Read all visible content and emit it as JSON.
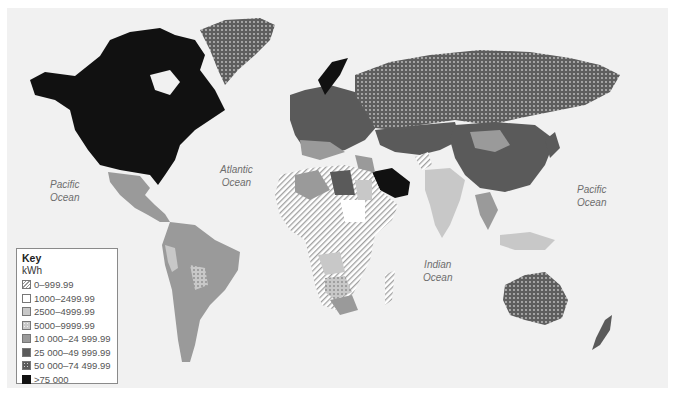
{
  "map": {
    "subject": "Electricity consumption per capita by country",
    "ocean_labels": [
      {
        "id": "pacific-west",
        "line1": "Pacific",
        "line2": "Ocean"
      },
      {
        "id": "atlantic",
        "line1": "Atlantic",
        "line2": "Ocean"
      },
      {
        "id": "indian",
        "line1": "Indian",
        "line2": "Ocean"
      },
      {
        "id": "pacific-east",
        "line1": "Pacific",
        "line2": "Ocean"
      }
    ]
  },
  "legend": {
    "title": "Key",
    "unit": "kWh",
    "items": [
      {
        "label": "0–999.99",
        "fill": "hatched",
        "color": "#ffffff"
      },
      {
        "label": "1000–2499.99",
        "fill": "solid",
        "color": "#ffffff"
      },
      {
        "label": "2500–4999.99",
        "fill": "solid",
        "color": "#c8c8c8"
      },
      {
        "label": "5000–9999.99",
        "fill": "dotted",
        "color": "#c8c8c8"
      },
      {
        "label": "10 000–24 999.99",
        "fill": "solid",
        "color": "#9a9a9a"
      },
      {
        "label": "25 000–49 999.99",
        "fill": "solid",
        "color": "#5a5a5a"
      },
      {
        "label": "50 000–74 499.99",
        "fill": "dotted",
        "color": "#5a5a5a"
      },
      {
        "label": ">75 000",
        "fill": "solid",
        "color": "#111111"
      }
    ]
  },
  "regions": [
    {
      "name": "North America (USA, Canada)",
      "category": ">75 000"
    },
    {
      "name": "Greenland",
      "category": "50 000–74 499.99"
    },
    {
      "name": "Mexico & Central America",
      "category": "10 000–24 999.99"
    },
    {
      "name": "South America (most)",
      "category": "10 000–24 999.99"
    },
    {
      "name": "Peru",
      "category": "2500–4999.99"
    },
    {
      "name": "Bolivia",
      "category": "5000–9999.99"
    },
    {
      "name": "Russia",
      "category": "50 000–74 499.99"
    },
    {
      "name": "Norway",
      "category": ">75 000"
    },
    {
      "name": "Europe (most)",
      "category": "25 000–49 999.99"
    },
    {
      "name": "Saudi Arabia",
      "category": ">75 000"
    },
    {
      "name": "Afghanistan",
      "category": "0–999.99"
    },
    {
      "name": "China",
      "category": "25 000–49 999.99"
    },
    {
      "name": "Mongolia",
      "category": "10 000–24 999.99"
    },
    {
      "name": "India",
      "category": "2500–4999.99"
    },
    {
      "name": "Central Africa",
      "category": "0–999.99"
    },
    {
      "name": "Madagascar",
      "category": "0–999.99"
    },
    {
      "name": "Botswana / Namibia",
      "category": "5000–9999.99"
    },
    {
      "name": "South Africa",
      "category": "10 000–24 999.99"
    },
    {
      "name": "Australia",
      "category": "50 000–74 499.99"
    },
    {
      "name": "New Zealand",
      "category": "25 000–49 999.99"
    }
  ]
}
